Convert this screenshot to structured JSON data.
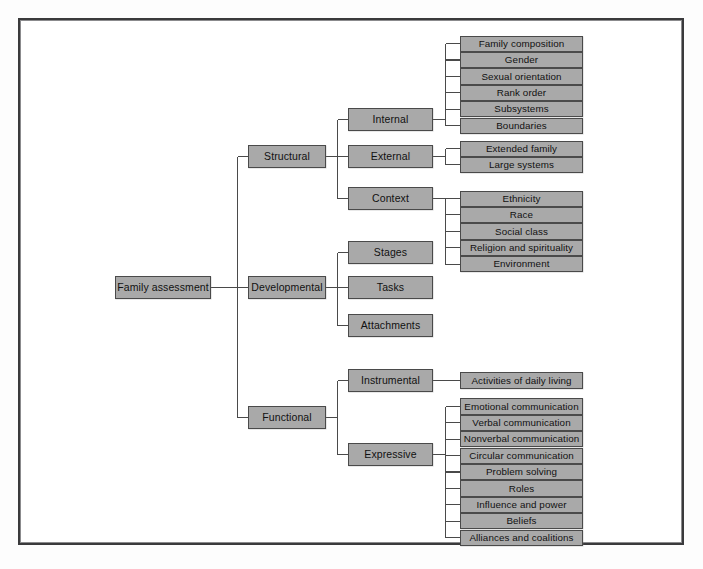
{
  "diagram": {
    "title": "Family assessment",
    "root": {
      "label": "Family assessment"
    },
    "branches": [
      {
        "label": "Structural",
        "subbranches": [
          {
            "label": "Internal",
            "items": [
              "Family composition",
              "Gender",
              "Sexual orientation",
              "Rank order",
              "Subsystems",
              "Boundaries"
            ]
          },
          {
            "label": "External",
            "items": [
              "Extended family",
              "Large systems"
            ]
          },
          {
            "label": "Context",
            "items": [
              "Ethnicity",
              "Race",
              "Social class",
              "Religion and spirituality",
              "Environment"
            ]
          }
        ]
      },
      {
        "label": "Developmental",
        "subbranches": [
          {
            "label": "Stages",
            "items": []
          },
          {
            "label": "Tasks",
            "items": []
          },
          {
            "label": "Attachments",
            "items": []
          }
        ]
      },
      {
        "label": "Functional",
        "subbranches": [
          {
            "label": "Instrumental",
            "items": [
              "Activities of daily living"
            ]
          },
          {
            "label": "Expressive",
            "items": [
              "Emotional communication",
              "Verbal communication",
              "Nonverbal communication",
              "Circular communication",
              "Problem solving",
              "Roles",
              "Influence and power",
              "Beliefs",
              "Alliances and coalitions"
            ]
          }
        ]
      }
    ]
  },
  "colors": {
    "node_fill": "#a9a9a9",
    "node_border": "#4a4a4a",
    "frame_border": "#3a3a3c",
    "line": "#4a4a4a",
    "page_background": "#ffffff",
    "text": "#111111"
  }
}
